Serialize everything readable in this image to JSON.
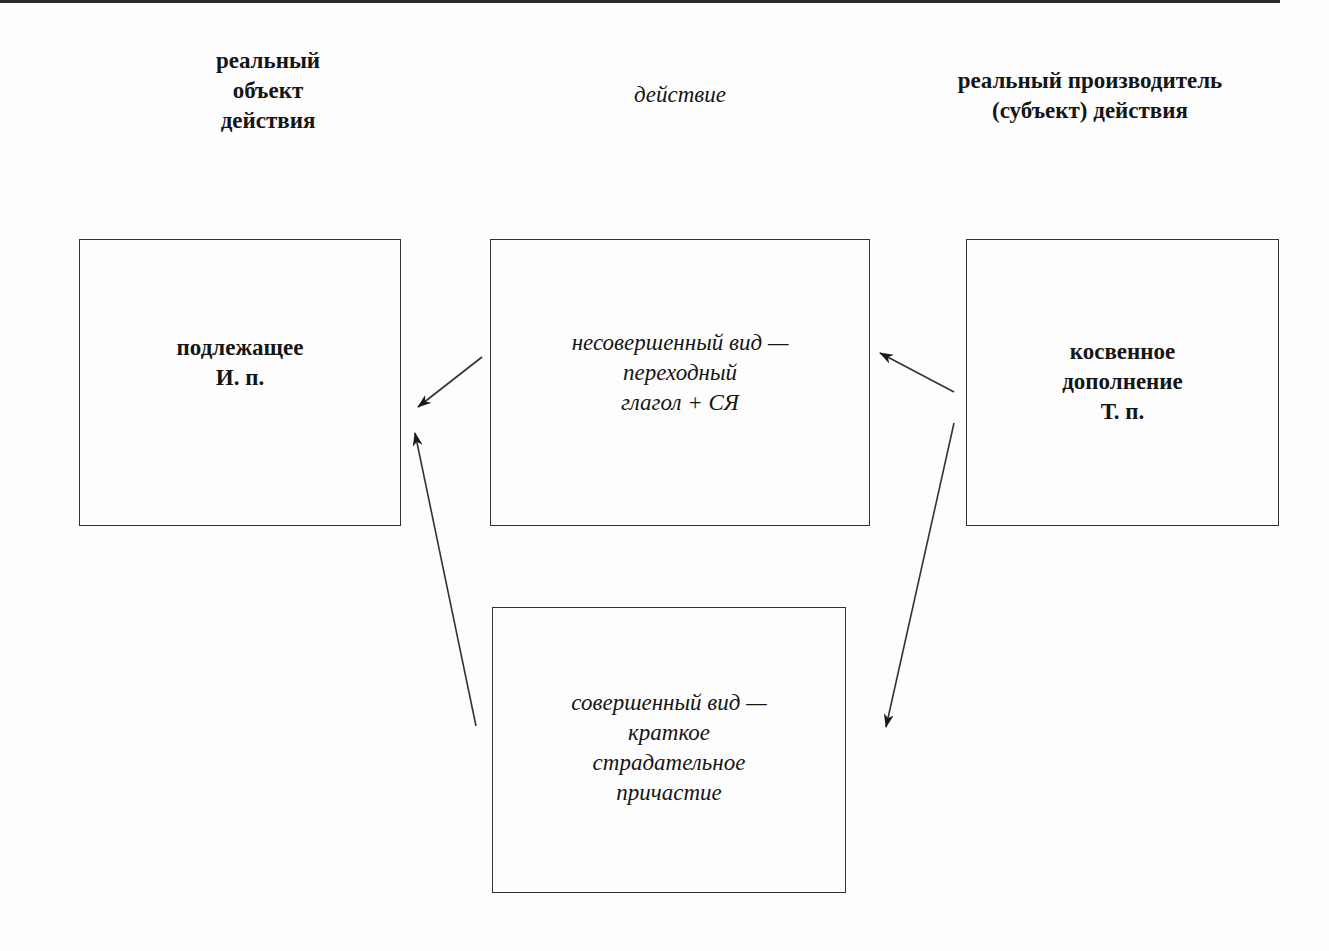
{
  "diagram": {
    "headers": {
      "object": {
        "lines": [
          "реальный",
          "объект",
          "действия"
        ]
      },
      "action": {
        "lines": [
          "действие"
        ]
      },
      "subject": {
        "lines": [
          "реальный производитель",
          "(субъект) действия"
        ]
      }
    },
    "boxes": {
      "subject_nominative": {
        "lines": [
          "подлежащее",
          "И. п."
        ]
      },
      "imperfective": {
        "lines": [
          "несовершенный вид —",
          "переходный",
          "глагол + СЯ"
        ]
      },
      "indirect_object": {
        "lines": [
          "косвенное",
          "дополнение",
          "Т. п."
        ]
      },
      "perfective": {
        "lines": [
          "совершенный вид —",
          "краткое",
          "страдательное",
          "причастие"
        ]
      }
    },
    "arrows": [
      {
        "from": "imperfective",
        "to": "subject_nominative",
        "label": ""
      },
      {
        "from": "indirect_object",
        "to": "imperfective",
        "label": ""
      },
      {
        "from": "perfective",
        "to": "subject_nominative",
        "label": ""
      },
      {
        "from": "indirect_object",
        "to": "perfective",
        "label": ""
      }
    ],
    "colors": {
      "ink": "#151515",
      "border": "#333333",
      "background": "#fdfdfd"
    }
  }
}
